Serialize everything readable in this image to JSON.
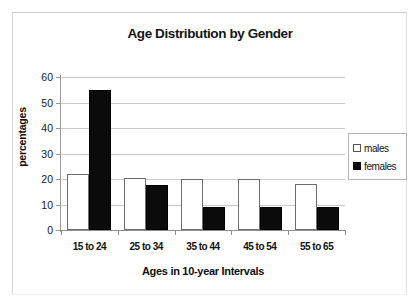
{
  "figure": {
    "background_color": "#ffffff",
    "frame_color": "#d8d8d8"
  },
  "chart_data": {
    "type": "bar",
    "title": "Age Distribution by Gender",
    "xlabel": "Ages in 10-year Intervals",
    "ylabel": "percentages",
    "categories": [
      "15 to 24",
      "25 to 34",
      "35 to 44",
      "45 to 54",
      "55 to 65"
    ],
    "series": [
      {
        "name": "males",
        "color": "#ffffff",
        "edge_color": "#6e6e6e",
        "values": [
          22,
          20.5,
          20,
          20,
          18
        ]
      },
      {
        "name": "females",
        "color": "#0b0b0b",
        "edge_color": "#000000",
        "values": [
          55,
          17.5,
          9,
          9,
          9
        ]
      }
    ],
    "ylim": [
      0,
      60
    ],
    "ytick_values": [
      0,
      10,
      20,
      30,
      40,
      50,
      60
    ],
    "ytick_labels": [
      "0",
      "10",
      "20",
      "30",
      "40",
      "50",
      "60"
    ],
    "grid": true,
    "grid_axis": "y",
    "grid_color": "#c9c9c9",
    "legend_position": "right",
    "legend_entries": [
      "males",
      "females"
    ]
  }
}
